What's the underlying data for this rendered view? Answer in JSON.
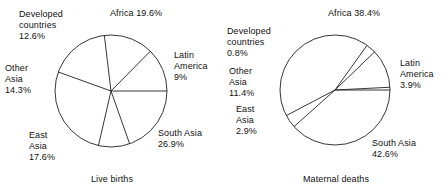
{
  "figure": {
    "type": "pie-pair",
    "background": "#ffffff",
    "stroke_color": "#202020",
    "text_color": "#111111"
  },
  "chart_data": [
    {
      "type": "pie",
      "title": "Live births",
      "caption": "Live births",
      "categories": [
        "Africa",
        "Latin America",
        "South Asia",
        "East Asia",
        "Other Asia",
        "Developed countries"
      ],
      "values": [
        19.6,
        9.0,
        26.9,
        17.6,
        14.3,
        12.6
      ],
      "value_unit": "%",
      "labels": [
        {
          "name": "Africa",
          "value": "19.6%",
          "text": "Africa 19.6%"
        },
        {
          "name": "Latin America",
          "value": "9%",
          "text": "Latin\nAmerica\n9%"
        },
        {
          "name": "South Asia",
          "value": "26.9%",
          "text": "South Asia\n26.9%"
        },
        {
          "name": "East Asia",
          "value": "17.6%",
          "text": "East\nAsia\n17.6%"
        },
        {
          "name": "Other Asia",
          "value": "14.3%",
          "text": "Other\nAsia\n14.3%"
        },
        {
          "name": "Developed countries",
          "value": "12.6%",
          "text": "Developed\ncountries\n12.6%"
        }
      ],
      "start_angle_deg": 0,
      "legend": "none",
      "grid": false,
      "xlabel": "",
      "ylabel": ""
    },
    {
      "type": "pie",
      "title": "Maternal deaths",
      "caption": "Maternal deaths",
      "categories": [
        "Africa",
        "Latin America",
        "South Asia",
        "East Asia",
        "Other Asia",
        "Developed countries"
      ],
      "values": [
        38.4,
        3.9,
        42.6,
        2.9,
        11.4,
        0.8
      ],
      "value_unit": "%",
      "labels": [
        {
          "name": "Africa",
          "value": "38.4%",
          "text": "Africa 38.4%"
        },
        {
          "name": "Latin America",
          "value": "3.9%",
          "text": "Latin\nAmerica\n3.9%"
        },
        {
          "name": "South Asia",
          "value": "42.6%",
          "text": "South Asia\n42.6%"
        },
        {
          "name": "East Asia",
          "value": "2.9%",
          "text": "East\nAsia\n2.9%"
        },
        {
          "name": "Other Asia",
          "value": "11.4%",
          "text": "Other\nAsia\n11.4%"
        },
        {
          "name": "Developed countries",
          "value": "0.8%",
          "text": "Developed\ncountries\n0.8%"
        }
      ],
      "start_angle_deg": 0,
      "legend": "none",
      "grid": false,
      "xlabel": "",
      "ylabel": ""
    }
  ],
  "geometry": {
    "left_pie": {
      "cx": 111,
      "cy": 91,
      "r": 56
    },
    "right_pie": {
      "cx": 111,
      "cy": 90,
      "r": 55
    }
  },
  "label_positions": {
    "live_births": {
      "africa": {
        "left": 110,
        "top": 8
      },
      "latin_america": {
        "left": 174,
        "top": 50
      },
      "south_asia": {
        "left": 158,
        "top": 128
      },
      "east_asia": {
        "left": 29,
        "top": 130
      },
      "other_asia": {
        "left": 5,
        "top": 63
      },
      "developed": {
        "left": 19,
        "top": 9
      }
    },
    "maternal_deaths": {
      "africa": {
        "left": 104,
        "top": 8
      },
      "latin_america": {
        "left": 176,
        "top": 58
      },
      "south_asia": {
        "left": 148,
        "top": 138
      },
      "east_asia": {
        "left": 12,
        "top": 104
      },
      "other_asia": {
        "left": 5,
        "top": 66
      },
      "developed": {
        "left": 3,
        "top": 26
      }
    }
  }
}
